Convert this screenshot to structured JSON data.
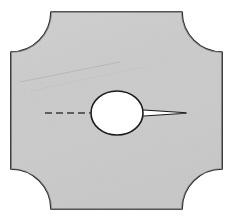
{
  "figure": {
    "kind": "engineering-part-drawing",
    "canvas": {
      "width": 231,
      "height": 219,
      "background": "#ffffff"
    },
    "colors": {
      "body_fill": "#cbcbcb",
      "body_fill_light": "#d6d6d6",
      "body_fill_dark": "#c2c2c2",
      "outline": "#1c1c1c",
      "hole_fill": "#ffffff",
      "centerline": "#3a3a3a",
      "crease": "#b4b4b4"
    },
    "plate": {
      "name": "plate-body",
      "left": 11,
      "top": 12,
      "right": 222,
      "bottom": 209,
      "corner_notch_radius": 40,
      "notch_type": "concave-quarter-round",
      "outline_width": 1.7
    },
    "bore": {
      "name": "elliptical-bore",
      "center_x": 117,
      "center_y": 113,
      "radius_x": 26,
      "radius_y": 22,
      "fill": "#ffffff",
      "outline_width": 1.6
    },
    "centerline": {
      "name": "horizontal-centerline",
      "style": "dashed",
      "x_start": 45,
      "x_end": 92,
      "y": 113,
      "dash_pattern": "7 4",
      "width": 1.4
    },
    "slot": {
      "name": "tapered-relief-slot",
      "x_start": 140,
      "x_end": 186,
      "y": 113,
      "mouth_half_height": 3.2,
      "tip_half_height": 0.3,
      "outline_width": 1.2
    },
    "crease": {
      "name": "paper-crease-artifact",
      "x_start": 20,
      "y_start": 82,
      "x_end": 120,
      "y_end": 62,
      "width": 0.9
    }
  }
}
